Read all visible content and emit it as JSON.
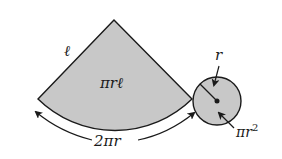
{
  "diagram": {
    "sector": {
      "slant_label": "ℓ",
      "area_label": "πrℓ",
      "arc_label": "2πr",
      "fill": "#c8c8c8",
      "stroke": "#1a1a1a"
    },
    "circle": {
      "radius_label": "r",
      "area_label": "πr",
      "area_exponent": "2",
      "fill": "#c8c8c8",
      "stroke": "#1a1a1a"
    }
  }
}
